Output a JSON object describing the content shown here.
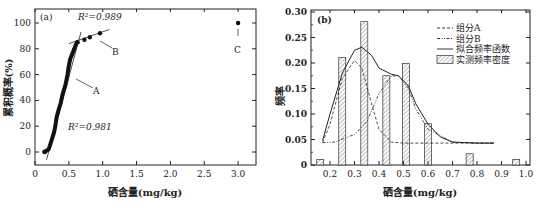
{
  "chart_data": [
    {
      "panel": "(a)",
      "type": "scatter",
      "title": "",
      "xlabel": "硒含量(mg/kg)",
      "ylabel": "累积概率(%)",
      "xlim": [
        0,
        3.25
      ],
      "ylim": [
        -10,
        110
      ],
      "xticks": [
        "0",
        "0.5",
        "1.0",
        "1.5",
        "2.0",
        "2.5",
        "3.0"
      ],
      "yticks": [
        "0",
        "20",
        "40",
        "60",
        "80",
        "100"
      ],
      "annotations": [
        {
          "text": "R²=0.989",
          "near": "segment B"
        },
        {
          "text": "R²=0.981",
          "near": "segment A"
        },
        {
          "text": "A",
          "arrow_to": [
            0.58,
            60
          ]
        },
        {
          "text": "B",
          "arrow_to": [
            0.95,
            92
          ]
        },
        {
          "text": "C",
          "arrow_to": [
            3.0,
            100
          ]
        }
      ],
      "series": [
        {
          "name": "A",
          "x": [
            0.14,
            0.2,
            0.22,
            0.25,
            0.28,
            0.3,
            0.32,
            0.35,
            0.38,
            0.4,
            0.42,
            0.45,
            0.48,
            0.5,
            0.52,
            0.55,
            0.58,
            0.6,
            0.62
          ],
          "y": [
            0,
            2,
            5,
            10,
            15,
            20,
            27,
            33,
            38,
            43,
            47,
            52,
            60,
            67,
            72,
            76,
            80,
            83,
            85
          ]
        },
        {
          "name": "B",
          "x": [
            0.63,
            0.73,
            0.81,
            0.96
          ],
          "y": [
            85,
            87,
            89,
            92
          ]
        },
        {
          "name": "C",
          "x": [
            3.0
          ],
          "y": [
            100
          ]
        }
      ],
      "fit_lines": [
        {
          "name": "A-fit",
          "r2": 0.981
        },
        {
          "name": "B-fit",
          "r2": 0.989
        }
      ]
    },
    {
      "panel": "(b)",
      "type": "bar",
      "title": "",
      "xlabel": "硒含量(mg/kg)",
      "ylabel": "频率",
      "xlim": [
        0.12,
        1.0
      ],
      "ylim": [
        0,
        0.3
      ],
      "xticks": [
        "0.2",
        "0.3",
        "0.4",
        "0.5",
        "0.6",
        "0.7",
        "0.8",
        "0.9",
        "1.0"
      ],
      "yticks": [
        "0",
        "0.05",
        "0.10",
        "0.15",
        "0.20",
        "0.25",
        "0.30"
      ],
      "legend": [
        "组分A",
        "组分B",
        "拟合频率函数",
        "实测频率密度"
      ],
      "legend_position": "upper right",
      "bars": {
        "name": "实测频率密度",
        "x": [
          0.16,
          0.25,
          0.34,
          0.43,
          0.51,
          0.6,
          0.77,
          0.96
        ],
        "values": [
          0.011,
          0.211,
          0.281,
          0.175,
          0.199,
          0.081,
          0.022,
          0.011
        ]
      },
      "series": [
        {
          "name": "组分A",
          "style": "dashed",
          "x": [
            0.17,
            0.2,
            0.25,
            0.3,
            0.33,
            0.37,
            0.4,
            0.45,
            0.5,
            0.6,
            0.7,
            0.8,
            0.87
          ],
          "y": [
            0.044,
            0.08,
            0.17,
            0.205,
            0.19,
            0.12,
            0.07,
            0.045,
            0.043,
            0.043,
            0.043,
            0.043,
            0.043
          ]
        },
        {
          "name": "组分B",
          "style": "dash-dot-dot",
          "x": [
            0.17,
            0.22,
            0.3,
            0.35,
            0.4,
            0.45,
            0.48,
            0.52,
            0.55,
            0.6,
            0.7,
            0.8,
            0.87
          ],
          "y": [
            0.044,
            0.045,
            0.06,
            0.085,
            0.14,
            0.175,
            0.175,
            0.15,
            0.11,
            0.07,
            0.045,
            0.043,
            0.043
          ]
        },
        {
          "name": "拟合频率函数",
          "style": "solid",
          "x": [
            0.17,
            0.2,
            0.25,
            0.3,
            0.33,
            0.37,
            0.4,
            0.45,
            0.48,
            0.52,
            0.55,
            0.6,
            0.65,
            0.7,
            0.8,
            0.87
          ],
          "y": [
            0.048,
            0.1,
            0.18,
            0.225,
            0.231,
            0.215,
            0.19,
            0.178,
            0.175,
            0.155,
            0.12,
            0.08,
            0.055,
            0.045,
            0.043,
            0.043
          ]
        }
      ]
    }
  ]
}
